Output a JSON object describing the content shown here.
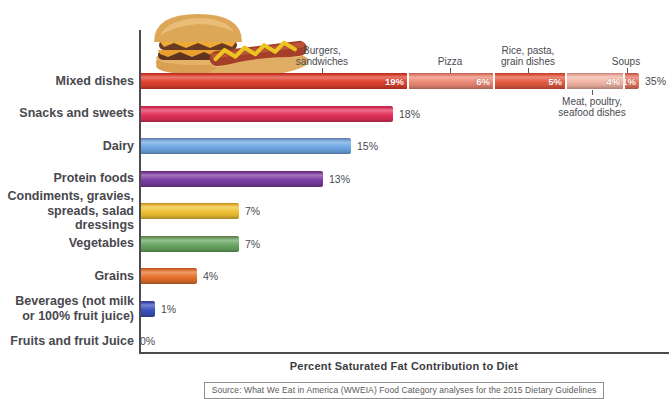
{
  "source": "Source: What We Eat in America (WWEIA) Food Category analyses for the 2015 Dietary Guidelines",
  "icons": {
    "food_image": "burger-and-hotdog-photo"
  },
  "chart_data": {
    "type": "bar",
    "orientation": "horizontal",
    "title": "",
    "xlabel": "Percent Saturated Fat Contribution to Diet",
    "ylabel": "",
    "xlim": [
      0,
      38
    ],
    "grid": false,
    "legend": "none",
    "bars": [
      {
        "category": "Mixed dishes",
        "value": 35,
        "value_label": "35%",
        "segments": [
          {
            "name": "Burgers, sandwiches",
            "value": 19,
            "value_label": "19%",
            "color": "#e0412f"
          },
          {
            "name": "Pizza",
            "value": 6,
            "value_label": "6%",
            "color": "#ee8a74"
          },
          {
            "name": "Rice, pasta, grain dishes",
            "value": 5,
            "value_label": "5%",
            "color": "#e65a41"
          },
          {
            "name": "Meat, poultry, seafood dishes",
            "value": 4,
            "value_label": "4%",
            "color": "#f4b6a6"
          },
          {
            "name": "Soups",
            "value": 1,
            "value_label": "1%",
            "color": "#e87760"
          }
        ]
      },
      {
        "category": "Snacks and sweets",
        "value": 18,
        "value_label": "18%",
        "color": "#e5315c"
      },
      {
        "category": "Dairy",
        "value": 15,
        "value_label": "15%",
        "color": "#6fa8e6"
      },
      {
        "category": "Protein foods",
        "value": 13,
        "value_label": "13%",
        "color": "#7b3da1"
      },
      {
        "category": "Condiments, gravies,\nspreads, salad dressings",
        "value": 7,
        "value_label": "7%",
        "color": "#efc233"
      },
      {
        "category": "Vegetables",
        "value": 7,
        "value_label": "7%",
        "color": "#69a762"
      },
      {
        "category": "Grains",
        "value": 4,
        "value_label": "4%",
        "color": "#e7712b"
      },
      {
        "category": "Beverages (not milk\nor 100% fruit juice)",
        "value": 1,
        "value_label": "1%",
        "color": "#3a50bf"
      },
      {
        "category": "Fruits and fruit Juice",
        "value": 0,
        "value_label": "0%",
        "color": "#888888"
      }
    ],
    "callouts": [
      {
        "text": "Burgers,\nsandwiches",
        "target_segment": "Burgers, sandwiches",
        "position": "above"
      },
      {
        "text": "Pizza",
        "target_segment": "Pizza",
        "position": "above"
      },
      {
        "text": "Rice, pasta,\ngrain dishes",
        "target_segment": "Rice, pasta, grain dishes",
        "position": "above"
      },
      {
        "text": "Soups",
        "target_segment": "Soups",
        "position": "above"
      },
      {
        "text": "Meat, poultry,\nseafood dishes",
        "target_segment": "Meat, poultry, seafood dishes",
        "position": "below"
      }
    ]
  }
}
